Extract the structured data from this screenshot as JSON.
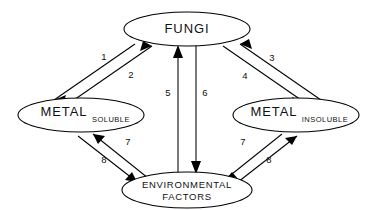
{
  "diagram": {
    "type": "concept-cycle-diagram",
    "background_color": "#ffffff",
    "line_color": "#000000",
    "text_color": "#111111",
    "nodes": [
      {
        "id": "fungi",
        "label": "FUNGI",
        "subscript": "",
        "cx": 187,
        "cy": 29,
        "rx": 63,
        "ry": 17
      },
      {
        "id": "metal-soluble",
        "label": "METAL",
        "subscript": "SOLUBLE",
        "cx": 81,
        "cy": 115,
        "rx": 63,
        "ry": 17
      },
      {
        "id": "metal-insoluble",
        "label": "METAL",
        "subscript": "INSOLUBLE",
        "cx": 296,
        "cy": 115,
        "rx": 63,
        "ry": 17
      },
      {
        "id": "environmental-factors",
        "label_line1": "ENVIRONMENTAL",
        "label_line2": "FACTORS",
        "cx": 187,
        "cy": 190,
        "rx": 65,
        "ry": 18
      }
    ],
    "edges": [
      {
        "id": "edge-1",
        "number": "1",
        "from": "fungi",
        "to": "metal-soluble",
        "label_x": 104,
        "label_y": 57
      },
      {
        "id": "edge-2",
        "number": "2",
        "from": "metal-soluble",
        "to": "fungi",
        "label_x": 131,
        "label_y": 75
      },
      {
        "id": "edge-3",
        "number": "3",
        "from": "metal-insoluble",
        "to": "fungi",
        "label_x": 272,
        "label_y": 58
      },
      {
        "id": "edge-4",
        "number": "4",
        "from": "fungi",
        "to": "metal-insoluble",
        "label_x": 245,
        "label_y": 76
      },
      {
        "id": "edge-5",
        "number": "5",
        "from": "environmental-factors",
        "to": "fungi",
        "label_x": 168,
        "label_y": 93
      },
      {
        "id": "edge-6",
        "number": "6",
        "from": "fungi",
        "to": "environmental-factors",
        "label_x": 205,
        "label_y": 93
      },
      {
        "id": "edge-7-left",
        "number": "7",
        "from": "environmental-factors",
        "to": "metal-soluble",
        "label_x": 128,
        "label_y": 142
      },
      {
        "id": "edge-8-left",
        "number": "8",
        "from": "metal-soluble",
        "to": "environmental-factors",
        "label_x": 104,
        "label_y": 160
      },
      {
        "id": "edge-7-right",
        "number": "7",
        "from": "metal-insoluble",
        "to": "environmental-factors",
        "label_x": 243,
        "label_y": 142
      },
      {
        "id": "edge-8-right",
        "number": "8",
        "from": "environmental-factors",
        "to": "metal-insoluble",
        "label_x": 269,
        "label_y": 160
      }
    ]
  }
}
